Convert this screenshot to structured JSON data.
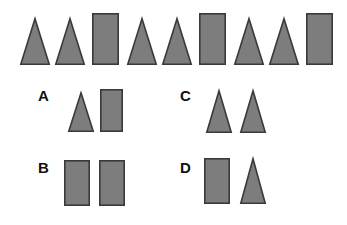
{
  "puzzle": {
    "type": "shape-sequence-completion",
    "canvas": {
      "width": 347,
      "height": 225,
      "background": "#ffffff"
    },
    "style": {
      "fill": "#7d7d7d",
      "stroke": "#3a3a3a",
      "stroke_width": 1.6,
      "label_color": "#111111"
    },
    "sequence": {
      "name": "top-sequence",
      "pattern": "triangle, triangle, rectangle (repeating)",
      "count": 9,
      "shapes": [
        {
          "index": 1,
          "kind": "triangle",
          "x": 20,
          "y": 18,
          "w": 30,
          "h": 47
        },
        {
          "index": 2,
          "kind": "triangle",
          "x": 55,
          "y": 18,
          "w": 30,
          "h": 47
        },
        {
          "index": 3,
          "kind": "rectangle",
          "x": 92,
          "y": 13,
          "w": 27,
          "h": 52
        },
        {
          "index": 4,
          "kind": "triangle",
          "x": 127,
          "y": 18,
          "w": 30,
          "h": 47
        },
        {
          "index": 5,
          "kind": "triangle",
          "x": 162,
          "y": 18,
          "w": 30,
          "h": 47
        },
        {
          "index": 6,
          "kind": "rectangle",
          "x": 199,
          "y": 13,
          "w": 27,
          "h": 52
        },
        {
          "index": 7,
          "kind": "triangle",
          "x": 234,
          "y": 18,
          "w": 30,
          "h": 47
        },
        {
          "index": 8,
          "kind": "triangle",
          "x": 269,
          "y": 18,
          "w": 30,
          "h": 47
        },
        {
          "index": 9,
          "kind": "rectangle",
          "x": 306,
          "y": 13,
          "w": 27,
          "h": 52
        }
      ]
    },
    "options": [
      {
        "id": "A",
        "label": "A",
        "label_x": 38,
        "label_y": 88,
        "shapes": [
          {
            "kind": "triangle",
            "x": 68,
            "y": 92,
            "w": 26,
            "h": 40
          },
          {
            "kind": "rectangle",
            "x": 100,
            "y": 89,
            "w": 23,
            "h": 43
          }
        ]
      },
      {
        "id": "B",
        "label": "B",
        "label_x": 38,
        "label_y": 160,
        "shapes": [
          {
            "kind": "rectangle",
            "x": 64,
            "y": 160,
            "w": 26,
            "h": 46
          },
          {
            "kind": "rectangle",
            "x": 99,
            "y": 160,
            "w": 26,
            "h": 46
          }
        ]
      },
      {
        "id": "C",
        "label": "C",
        "label_x": 180,
        "label_y": 88,
        "shapes": [
          {
            "kind": "triangle",
            "x": 206,
            "y": 90,
            "w": 26,
            "h": 43
          },
          {
            "kind": "triangle",
            "x": 240,
            "y": 90,
            "w": 26,
            "h": 43
          }
        ]
      },
      {
        "id": "D",
        "label": "D",
        "label_x": 180,
        "label_y": 160,
        "shapes": [
          {
            "kind": "rectangle",
            "x": 204,
            "y": 158,
            "w": 26,
            "h": 46
          },
          {
            "kind": "triangle",
            "x": 240,
            "y": 158,
            "w": 26,
            "h": 46
          }
        ]
      }
    ]
  }
}
